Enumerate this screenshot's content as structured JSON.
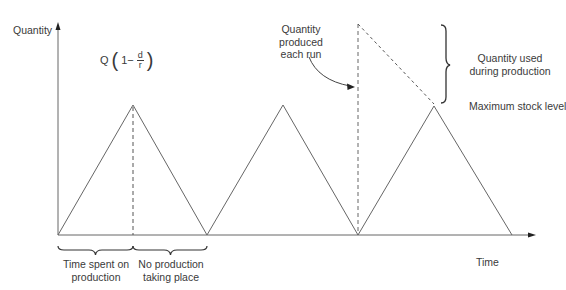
{
  "diagram": {
    "axes": {
      "y_label": "Quantity",
      "x_label": "Time"
    },
    "formula": {
      "prefix": "Q",
      "open_paren": "(",
      "one_minus": "1−",
      "numerator": "d",
      "denominator": "r",
      "close_paren": ")"
    },
    "annotations": {
      "quantity_produced": [
        "Quantity",
        "produced",
        "each run"
      ],
      "quantity_used": [
        "Quantity used",
        "during production"
      ],
      "max_stock": "Maximum stock level",
      "time_production": [
        "Time spent on",
        "production"
      ],
      "no_production": [
        "No production",
        "taking place"
      ]
    },
    "cycles": [
      {
        "start_x": 58,
        "peak_x": 133,
        "end_x": 207
      },
      {
        "start_x": 207,
        "peak_x": 283,
        "end_x": 358
      },
      {
        "start_x": 358,
        "peak_x": 434,
        "end_x": 512
      }
    ],
    "colors": {
      "line": "#555555",
      "text": "#3a3a3a",
      "brace": "#333333"
    }
  }
}
